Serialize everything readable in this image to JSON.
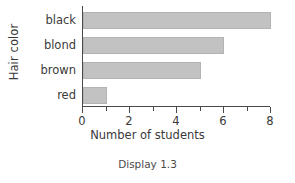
{
  "chart_data": {
    "type": "bar",
    "orientation": "horizontal",
    "title": "",
    "categories": [
      "black",
      "blond",
      "brown",
      "red"
    ],
    "values": [
      8,
      6,
      5,
      1
    ],
    "xlabel": "Number of students",
    "ylabel": "Hair color",
    "xlim": [
      0,
      8
    ],
    "xticks": [
      0,
      2,
      4,
      6,
      8
    ],
    "xtick_labels": [
      "0",
      "2",
      "4",
      "6",
      "8"
    ],
    "minor_xticks": [
      1,
      3,
      5,
      7
    ],
    "grid": false,
    "legend": false,
    "bar_color": "#c2c2c2",
    "bar_edge_color": "#b3b3b3",
    "axis_color": "#4a4a4a",
    "text_color": "#3a3a3a",
    "background": "#ffffff"
  },
  "caption": {
    "text": "Display 1.3"
  }
}
